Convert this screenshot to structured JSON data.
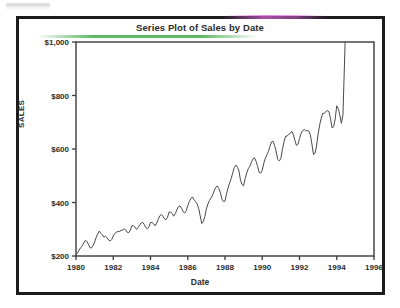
{
  "chart_data": {
    "type": "line",
    "title": "Series Plot of Sales by Date",
    "xlabel": "Date",
    "ylabel": "SALES",
    "xlim": [
      1980,
      1996
    ],
    "ylim": [
      200,
      1000
    ],
    "xticks": [
      "1980",
      "1982",
      "1984",
      "1986",
      "1988",
      "1990",
      "1992",
      "1994",
      "1996"
    ],
    "xtick_values": [
      1980,
      1982,
      1984,
      1986,
      1988,
      1990,
      1992,
      1994,
      1996
    ],
    "yticks": [
      "$200",
      "$400",
      "$600",
      "$800",
      "$1,000"
    ],
    "ytick_values": [
      200,
      400,
      600,
      800,
      1000
    ],
    "grid": false,
    "legend": false,
    "series": [
      {
        "name": "SALES",
        "color": "#4a4a4a",
        "x": [
          1980.0,
          1980.25,
          1980.5,
          1980.75,
          1981.0,
          1981.25,
          1981.5,
          1981.75,
          1982.0,
          1982.25,
          1982.5,
          1982.75,
          1983.0,
          1983.25,
          1983.5,
          1983.75,
          1984.0,
          1984.25,
          1984.5,
          1984.75,
          1985.0,
          1985.25,
          1985.5,
          1985.75,
          1986.0,
          1986.25,
          1986.5,
          1986.75,
          1987.0,
          1987.25,
          1987.5,
          1987.75,
          1988.0,
          1988.25,
          1988.5,
          1988.75,
          1989.0,
          1989.25,
          1989.5,
          1989.75,
          1990.0,
          1990.25,
          1990.5,
          1990.75,
          1991.0,
          1991.25,
          1991.5,
          1991.75,
          1992.0,
          1992.25,
          1992.5,
          1992.75,
          1993.0,
          1993.25,
          1993.5,
          1993.75,
          1994.0,
          1994.25,
          1994.45
        ],
        "values": [
          205,
          228,
          243,
          240,
          262,
          290,
          255,
          270,
          285,
          288,
          280,
          300,
          325,
          296,
          305,
          318,
          337,
          309,
          330,
          352,
          378,
          345,
          362,
          380,
          402,
          416,
          372,
          334,
          390,
          412,
          430,
          455,
          420,
          468,
          500,
          538,
          480,
          520,
          530,
          556,
          540,
          572,
          590,
          612,
          585,
          640,
          620,
          658,
          662,
          665,
          628,
          602,
          680,
          725,
          700,
          706,
          790,
          688,
          745
        ]
      }
    ],
    "series_extended": {
      "note": "monthly-resolution seasonal series; rendered path includes intra-year oscillation",
      "end_value": 1000,
      "start_value": 205,
      "peak_value": 1000,
      "trough_value": 205
    }
  },
  "artifacts": {
    "top_fringe_green": "#289632",
    "top_fringe_magenta": "#d660d6",
    "border_color": "#1c1c1c",
    "line_color": "#4a4a4a",
    "text_color": "#2b2b2b"
  }
}
